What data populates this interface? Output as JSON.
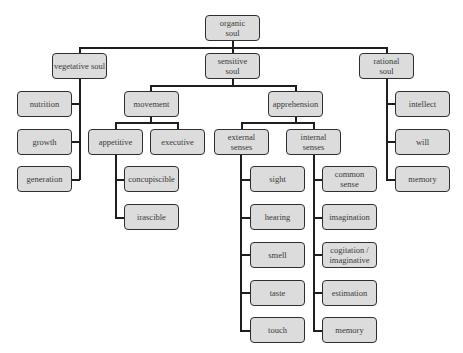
{
  "diagram": {
    "root": "organic\nsoul",
    "level1": {
      "vegetative": "vegetative soul",
      "sensitive": "sensitive\nsoul",
      "rational": "rational\nsoul"
    },
    "vegetative_children": [
      "nutrition",
      "growth",
      "generation"
    ],
    "sensitive_children": {
      "movement": "movement",
      "apprehension": "apprehension"
    },
    "movement_children": {
      "appetitive": "appetitive",
      "executive": "executive"
    },
    "appetitive_children": [
      "concupiscible",
      "irascible"
    ],
    "apprehension_children": {
      "external": "external\nsenses",
      "internal": "internal\nsenses"
    },
    "external_senses": [
      "sight",
      "hearing",
      "smell",
      "taste",
      "touch"
    ],
    "internal_senses": [
      "common\nsense",
      "imagination",
      "cogitation /\nimaginative",
      "estimation",
      "memory"
    ],
    "rational_children": [
      "intellect",
      "will",
      "memory"
    ],
    "colors": {
      "node_fill": "#dcdcdc",
      "node_border": "#2e2e2e",
      "connector": "#1e1e1e",
      "text": "#3a3a3a"
    }
  }
}
